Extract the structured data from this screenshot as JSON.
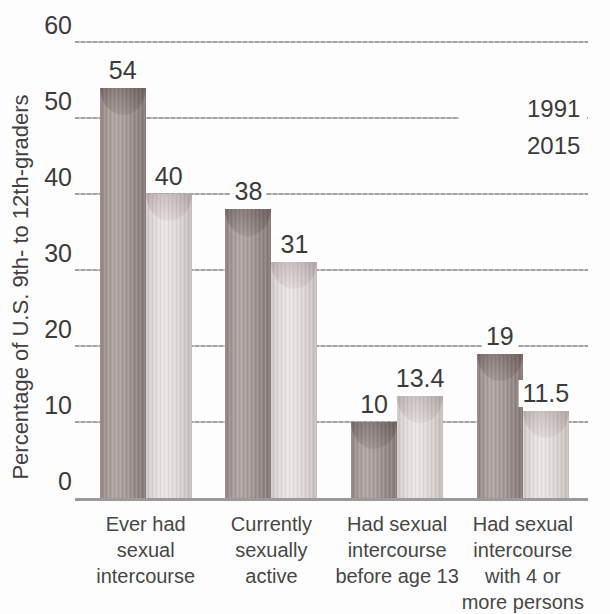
{
  "chart_data": {
    "type": "bar",
    "title": "",
    "ylabel": "Percentage of U.S. 9th- to 12th-graders",
    "xlabel": "",
    "ylim": [
      0,
      60
    ],
    "yticks": [
      0,
      10,
      20,
      30,
      40,
      50,
      60
    ],
    "grid": true,
    "legend_position": "upper right",
    "categories": [
      "Ever had sexual intercourse",
      "Currently sexually active",
      "Had sexual intercourse before age 13",
      "Had sexual intercourse with 4 or more persons"
    ],
    "categories_lines": [
      [
        "Ever had",
        "sexual",
        "intercourse"
      ],
      [
        "Currently",
        "sexually",
        "active"
      ],
      [
        "Had sexual",
        "intercourse",
        "before age 13"
      ],
      [
        "Had sexual",
        "intercourse",
        "with 4 or",
        "more persons"
      ]
    ],
    "series": [
      {
        "name": "1991",
        "values": [
          54,
          38,
          10,
          19
        ],
        "color": "#a79a98"
      },
      {
        "name": "2015",
        "values": [
          40,
          31,
          13.4,
          11.5
        ],
        "color": "#e0d9d7"
      }
    ],
    "value_labels": [
      "54",
      "40",
      "38",
      "31",
      "10",
      "13.4",
      "19",
      "11.5"
    ]
  },
  "colors": {
    "text": "#3b3b3b",
    "gridline": "#a9a9a9",
    "axis_line": "#9a9a9a",
    "background": "#fdfdfd"
  }
}
